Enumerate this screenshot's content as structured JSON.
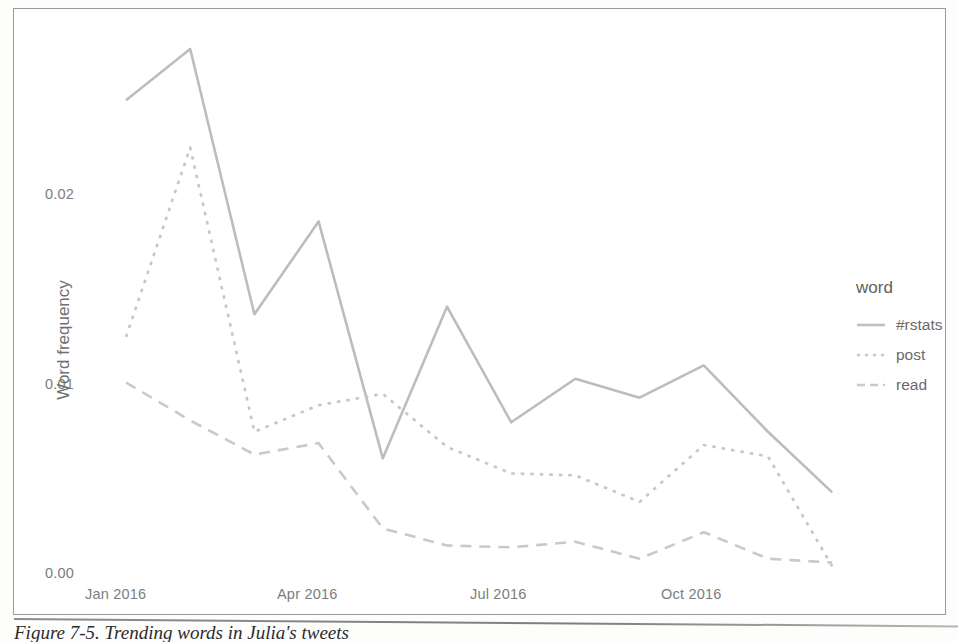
{
  "figure": {
    "caption": "Figure 7-5. Trending words in Julia's tweets"
  },
  "legend": {
    "title": "word",
    "entries": [
      {
        "label": "#rstats",
        "style": "solid",
        "color": "#bdbdbd"
      },
      {
        "label": "post",
        "style": "dotted",
        "color": "#c6c6c6"
      },
      {
        "label": "read",
        "style": "dashed",
        "color": "#c9c9c9"
      }
    ]
  },
  "axes": {
    "y_title": "Word frequency",
    "y_ticks": [
      "0.00",
      "0.01",
      "0.02"
    ],
    "y_tick_values": [
      0.0,
      0.01,
      0.02
    ],
    "x_ticks": [
      "Jan 2016",
      "Apr 2016",
      "Jul 2016",
      "Oct 2016"
    ],
    "x_tick_months": [
      0,
      3,
      6,
      9
    ]
  },
  "chart_data": {
    "type": "line",
    "title": "",
    "xlabel": "",
    "ylabel": "Word frequency",
    "ylim": [
      0.0,
      0.0265
    ],
    "xlim": [
      "Jan 2016",
      "Dec 2016"
    ],
    "grid": false,
    "legend": "right",
    "x": [
      "Jan 2016",
      "Feb 2016",
      "Mar 2016",
      "Apr 2016",
      "May 2016",
      "Jun 2016",
      "Jul 2016",
      "Aug 2016",
      "Sep 2016",
      "Oct 2016",
      "Nov 2016",
      "Dec 2016"
    ],
    "series": [
      {
        "name": "#rstats",
        "style": "solid",
        "color": "#bdbdbd",
        "values": [
          0.0249,
          0.0276,
          0.0136,
          0.0185,
          0.006,
          0.014,
          0.0079,
          0.0102,
          0.0092,
          0.0109,
          0.0074,
          0.0042
        ]
      },
      {
        "name": "post",
        "style": "dotted",
        "color": "#c6c6c6",
        "values": [
          0.0124,
          0.0224,
          0.0074,
          0.0088,
          0.0094,
          0.0066,
          0.0052,
          0.0051,
          0.0037,
          0.0067,
          0.0061,
          0.0003
        ]
      },
      {
        "name": "read",
        "style": "dashed",
        "color": "#c9c9c9",
        "values": [
          0.01,
          0.008,
          0.0062,
          0.0068,
          0.0023,
          0.0014,
          0.0013,
          0.0016,
          0.0007,
          0.0021,
          0.0007,
          0.0005
        ]
      }
    ]
  },
  "colors": {
    "line": "#bdbdbd",
    "tick_text": "#7d7d7d",
    "frame": "#9a9a9a"
  }
}
